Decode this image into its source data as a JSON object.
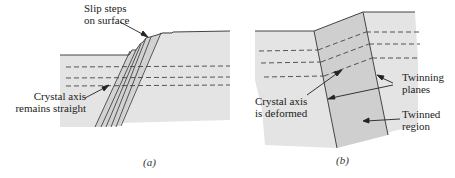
{
  "panels": [
    {
      "id": "a",
      "caption": "(a)",
      "labels": {
        "slip_steps_line1": "Slip steps",
        "slip_steps_line2": "on surface",
        "axis_line1": "Crystal axis",
        "axis_line2": "remains straight"
      }
    },
    {
      "id": "b",
      "caption": "(b)",
      "labels": {
        "axis_line1": "Crystal axis",
        "axis_line2": "is deformed",
        "twinning_line1": "Twinning",
        "twinning_line2": "planes",
        "twinned_line1": "Twinned",
        "twinned_line2": "region"
      }
    }
  ],
  "colors": {
    "crystal_fill": "#e4e4e4",
    "twinned_fill": "#cfcfcf",
    "slip_band_fill": "#d2d2d2",
    "line": "#333333"
  }
}
